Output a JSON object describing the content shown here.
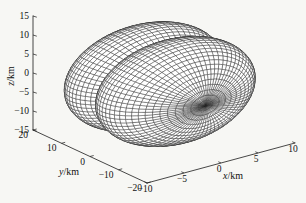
{
  "figure": {
    "background": "#f7f7f4",
    "mesh_line_color": "#1f1f1f",
    "mesh_face_color": "#ffffff",
    "axis_color": "#1a1a1a",
    "text_color": "#111111"
  },
  "chart_data": {
    "type": "surface",
    "title": "",
    "surface": {
      "axis_of_revolution": "y",
      "lobe_center_offset_km": 5.5,
      "lobe_semi_axes_km": {
        "x": 10,
        "y": 10.5,
        "z": 13
      },
      "center_km": [
        0,
        1.5,
        -1.75
      ],
      "mesh_lines": {
        "around": 72,
        "along_per_lobe": 22
      }
    },
    "axes": {
      "x": {
        "var": "x",
        "unit": "/km",
        "label": "x/km",
        "min": -10,
        "max": 10,
        "ticks": [
          -10,
          -5,
          0,
          5,
          10
        ]
      },
      "y": {
        "var": "y",
        "unit": "/km",
        "label": "y/km",
        "min": -20,
        "max": 20,
        "ticks": [
          20,
          10,
          0,
          -10,
          -20
        ]
      },
      "z": {
        "var": "z",
        "unit": "/km",
        "label": "z/km",
        "min": -15,
        "max": 15,
        "ticks": [
          15,
          10,
          5,
          0,
          -5,
          -10,
          -15
        ]
      }
    },
    "view": {
      "projection": "orthographic",
      "grid": false,
      "legend": false
    }
  }
}
